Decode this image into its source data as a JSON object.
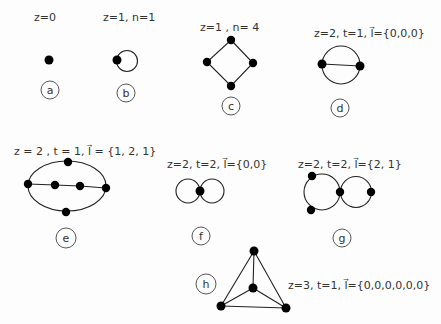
{
  "diagrams": [
    {
      "id": "a",
      "label": "z=0",
      "tag": "a"
    },
    {
      "id": "b",
      "label": "z=1, n=1",
      "tag": "b"
    },
    {
      "id": "c",
      "label": "z=1 , n= 4",
      "tag": "c"
    },
    {
      "id": "d",
      "label": "z=2, t=1, l⃗={0,0,0}",
      "tag": "d"
    },
    {
      "id": "e",
      "label": "z = 2 , t = 1, l⃗ = {1, 2, 1}",
      "tag": "e"
    },
    {
      "id": "f",
      "label": "z=2, t=2, l⃗={0,0}",
      "tag": "f"
    },
    {
      "id": "g",
      "label": "z=2, t=2, l⃗={2, 1}",
      "tag": "g"
    },
    {
      "id": "h",
      "label": "z=3, t=1, l⃗={0,0,0,0,0,0}",
      "tag": "h"
    }
  ],
  "colors": {
    "node": "#000000",
    "edge": "#222222",
    "text": "#333333",
    "background": "#fdfdfd"
  }
}
